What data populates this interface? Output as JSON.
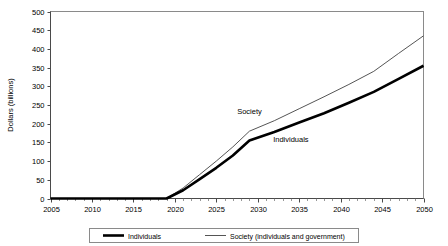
{
  "chart_data": {
    "type": "line",
    "title": "",
    "xlabel": "",
    "ylabel": "Dollars (billions)",
    "xlim": [
      2005,
      2050
    ],
    "ylim": [
      0,
      500
    ],
    "grid": false,
    "legend_position": "bottom",
    "x_ticks": [
      2005,
      2010,
      2015,
      2020,
      2025,
      2030,
      2035,
      2040,
      2045,
      2050
    ],
    "x_tick_labels": [
      "2005",
      "2010",
      "2015",
      "2020",
      "2025",
      "2030",
      "2035",
      "2040",
      "2045",
      "2050"
    ],
    "x_minor_tick_step": 1,
    "y_ticks": [
      0,
      50,
      100,
      150,
      200,
      250,
      300,
      350,
      400,
      450,
      500
    ],
    "y_tick_labels": [
      "0",
      "50",
      "100",
      "150",
      "200",
      "250",
      "300",
      "350",
      "400",
      "450",
      "500"
    ],
    "x": [
      2005,
      2010,
      2015,
      2019,
      2021,
      2023,
      2025,
      2027,
      2029,
      2032,
      2035,
      2038,
      2041,
      2044,
      2047,
      2050
    ],
    "series": [
      {
        "name": "Individuals",
        "style": "thick",
        "color": "#000000",
        "annotation": "Individuals",
        "values": [
          0,
          0,
          0,
          0,
          22,
          52,
          82,
          115,
          155,
          178,
          203,
          228,
          256,
          285,
          320,
          355
        ]
      },
      {
        "name": "Society (individuals and government)",
        "style": "thin",
        "color": "#555555",
        "annotation": "Society",
        "values": [
          0,
          0,
          0,
          0,
          28,
          64,
          100,
          138,
          180,
          208,
          240,
          272,
          305,
          340,
          388,
          435
        ]
      }
    ],
    "annotations": [
      {
        "text": "Society",
        "x": 2029,
        "y": 225
      },
      {
        "text": "Individuals",
        "x": 2034,
        "y": 150
      }
    ],
    "legend": [
      {
        "label": "Individuals",
        "style": "thick",
        "color": "#000000"
      },
      {
        "label": "Society (individuals and government)",
        "style": "thin",
        "color": "#555555"
      }
    ]
  }
}
